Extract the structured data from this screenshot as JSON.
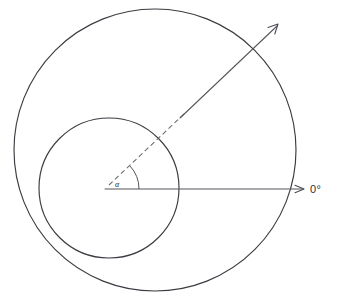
{
  "figure": {
    "background_color": "#ffffff",
    "line_color": "#3b3b42",
    "width": 339,
    "height": 301
  },
  "labels": {
    "reference_axis": "0°",
    "angle_symbol": "α"
  },
  "geometry": {
    "outer_circle": {
      "name": "outer-circle",
      "center_x": 155,
      "center_y": 150,
      "radius": 141
    },
    "inner_circle": {
      "name": "inner-circle",
      "center_x": 109,
      "center_y": 188,
      "radius": 70
    },
    "origin": {
      "x": 105,
      "y": 189
    },
    "reference_ray": {
      "name": "zero-degree-ray",
      "from_x": 105,
      "from_y": 189,
      "to_x": 306,
      "to_y": 189,
      "angle_degrees": 0
    },
    "angled_ray": {
      "name": "angled-ray",
      "from_x": 105,
      "from_y": 189,
      "to_x": 280,
      "to_y": 23,
      "angle_degrees": 43,
      "dashed_portion_end_x": 183,
      "dashed_portion_end_y": 115
    },
    "angle_arc": {
      "name": "angle-arc",
      "radius": 34,
      "start_angle_degrees": 0,
      "end_angle_degrees": 43
    }
  }
}
